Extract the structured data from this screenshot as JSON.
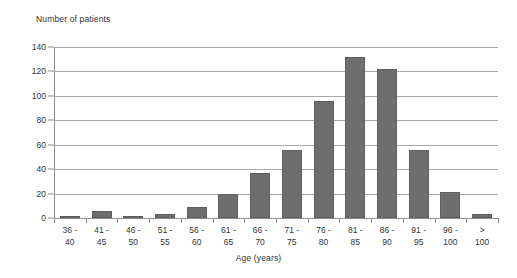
{
  "chart_data": {
    "type": "bar",
    "title": "",
    "ylabel": "Number of patients",
    "xlabel": "Age (years)",
    "categories": [
      "36 - 40",
      "41 - 45",
      "46 - 50",
      "51 - 55",
      "56 - 60",
      "61 - 65",
      "66 - 70",
      "71 - 75",
      "76 - 80",
      "81 - 85",
      "86 - 90",
      "91 - 95",
      "96 - 100",
      "> 100"
    ],
    "category_lines": [
      [
        "36 -",
        "40"
      ],
      [
        "41 -",
        "45"
      ],
      [
        "46 -",
        "50"
      ],
      [
        "51 -",
        "55"
      ],
      [
        "56 -",
        "60"
      ],
      [
        "61 -",
        "65"
      ],
      [
        "66 -",
        "70"
      ],
      [
        "71 -",
        "75"
      ],
      [
        "76 -",
        "80"
      ],
      [
        "81 -",
        "85"
      ],
      [
        "86 -",
        "90"
      ],
      [
        "91 -",
        "95"
      ],
      [
        "96 -",
        "100"
      ],
      [
        ">",
        "100"
      ]
    ],
    "values": [
      2,
      6,
      2,
      3,
      9,
      20,
      37,
      56,
      96,
      132,
      122,
      56,
      21,
      3
    ],
    "ylim": [
      0,
      140
    ],
    "yticks": [
      0,
      20,
      40,
      60,
      80,
      100,
      120,
      140
    ],
    "ytick_labels": [
      "0",
      "20",
      "40",
      "60",
      "80",
      "100",
      "120",
      "140"
    ],
    "grid": true,
    "legend": false,
    "bar_color": "#6e6e6e",
    "grid_color": "#a8a8a8",
    "axis_color": "#8d8d8d",
    "background": "#ffffff"
  }
}
